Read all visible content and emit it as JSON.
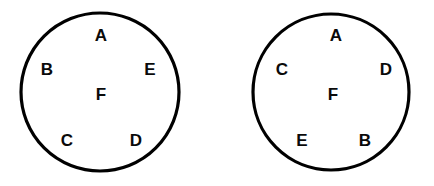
{
  "diagram": {
    "type": "circle-label-diagram",
    "canvas": {
      "width": 434,
      "height": 186
    },
    "background_color": "#ffffff",
    "stroke_color": "#000000",
    "label_color": "#0a0a0a",
    "stroke_width": 3.2,
    "figures": [
      {
        "id": "left-circle",
        "name": "Circle 1",
        "center_x": 100,
        "center_y": 92,
        "radius": 79,
        "labels": [
          {
            "text": "A",
            "position": "top",
            "x": 101,
            "y": 37
          },
          {
            "text": "B",
            "position": "left",
            "x": 47,
            "y": 71
          },
          {
            "text": "E",
            "position": "right",
            "x": 150,
            "y": 71
          },
          {
            "text": "F",
            "position": "center",
            "x": 101,
            "y": 96
          },
          {
            "text": "C",
            "position": "bottom-left",
            "x": 67,
            "y": 142
          },
          {
            "text": "D",
            "position": "bottom-right",
            "x": 136,
            "y": 142
          }
        ]
      },
      {
        "id": "right-circle",
        "name": "Circle 2",
        "center_x": 331,
        "center_y": 92,
        "radius": 78,
        "labels": [
          {
            "text": "A",
            "position": "top",
            "x": 336,
            "y": 37
          },
          {
            "text": "C",
            "position": "left",
            "x": 282,
            "y": 71
          },
          {
            "text": "D",
            "position": "right",
            "x": 386,
            "y": 71
          },
          {
            "text": "F",
            "position": "center",
            "x": 333,
            "y": 96
          },
          {
            "text": "E",
            "position": "bottom-left",
            "x": 302,
            "y": 142
          },
          {
            "text": "B",
            "position": "bottom-right",
            "x": 365,
            "y": 142
          }
        ]
      }
    ]
  }
}
